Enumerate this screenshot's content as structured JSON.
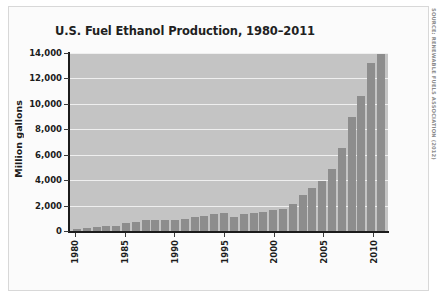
{
  "figure": {
    "title": "U.S. Fuel Ethanol Production, 1980–2011",
    "source_note": "SOURCE: RENEWABLE FUELS ASSOCIATION (2012)",
    "background_color": "#ffffff",
    "plot_background_color": "#c4c4c4",
    "bar_color": "#8d8d8d",
    "gridline_color": "#efefef",
    "axis_color": "#1c1c1c"
  },
  "chart_data": {
    "type": "bar",
    "title": "U.S. Fuel Ethanol Production, 1980–2011",
    "xlabel": "",
    "ylabel": "Million gallons",
    "ylim": [
      0,
      14000
    ],
    "ytick_values": [
      0,
      2000,
      4000,
      6000,
      8000,
      10000,
      12000,
      14000
    ],
    "ytick_labels": [
      "0",
      "2,000",
      "4,000",
      "6,000",
      "8,000",
      "10,000",
      "12,000",
      "14,000"
    ],
    "xtick_labels": [
      "1980",
      "1985",
      "1990",
      "1995",
      "2000",
      "2005",
      "2010"
    ],
    "grid": true,
    "legend": false,
    "categories": [
      "1980",
      "1981",
      "1982",
      "1983",
      "1984",
      "1985",
      "1986",
      "1987",
      "1988",
      "1989",
      "1990",
      "1991",
      "1992",
      "1993",
      "1994",
      "1995",
      "1996",
      "1997",
      "1998",
      "1999",
      "2000",
      "2001",
      "2002",
      "2003",
      "2004",
      "2005",
      "2006",
      "2007",
      "2008",
      "2009",
      "2010",
      "2011"
    ],
    "values": [
      175,
      215,
      350,
      375,
      430,
      610,
      710,
      830,
      845,
      870,
      900,
      950,
      1100,
      1200,
      1350,
      1400,
      1100,
      1300,
      1400,
      1470,
      1630,
      1770,
      2130,
      2800,
      3400,
      3904,
      4884,
      6500,
      9000,
      10600,
      13230,
      13900
    ],
    "units": "million gallons"
  }
}
